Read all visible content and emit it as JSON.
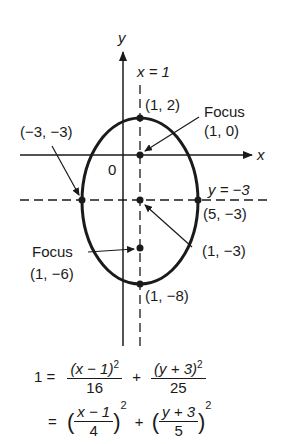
{
  "axes": {
    "x_label": "x",
    "y_label": "y",
    "origin_label": "0"
  },
  "lines": {
    "vertical_axis_of_symmetry": "x = 1",
    "horizontal_axis_of_symmetry": "y = −3"
  },
  "points": {
    "top_vertex": "(1, 2)",
    "bottom_vertex": "(1, −8)",
    "left_vertex": "(−3, −3)",
    "right_vertex": "(5, −3)",
    "center": "(1, −3)",
    "upper_focus_title": "Focus",
    "upper_focus": "(1, 0)",
    "lower_focus_title": "Focus",
    "lower_focus": "(1, −6)"
  },
  "equation": {
    "line1_lhs": "1 =",
    "term1_num": "(x − 1)",
    "term1_exp": "2",
    "term1_den": "16",
    "plus": "+",
    "term2_num": "(y + 3)",
    "term2_exp": "2",
    "term2_den": "25",
    "line2_lhs": "=",
    "term3_num": "x − 1",
    "term3_den": "4",
    "term3_exp": "2",
    "term4_num": "y + 3",
    "term4_den": "5",
    "term4_exp": "2"
  },
  "colors": {
    "ink": "#1a1a1a",
    "background": "#ffffff"
  }
}
